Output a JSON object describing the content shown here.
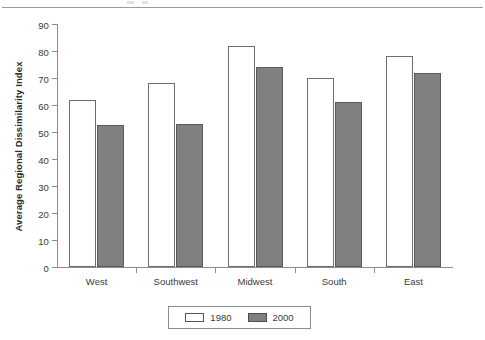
{
  "chart_data": {
    "type": "bar",
    "title": "",
    "subtitle": "",
    "xlabel": "",
    "ylabel": "Average Regional Dissimilarity Index",
    "categories": [
      "West",
      "Southwest",
      "Midwest",
      "South",
      "East"
    ],
    "series": [
      {
        "name": "1980",
        "values": [
          62,
          68,
          82,
          70,
          78
        ],
        "color": "#ffffff"
      },
      {
        "name": "2000",
        "values": [
          52.5,
          53,
          74,
          61,
          72
        ],
        "color": "#808080"
      }
    ],
    "ylim": [
      0,
      90
    ],
    "ytick_labels": [
      "90",
      "80",
      "70",
      "60",
      "50",
      "40",
      "30",
      "20",
      "10",
      "0"
    ],
    "ytick_values": [
      90,
      80,
      70,
      60,
      50,
      40,
      30,
      20,
      10,
      0
    ],
    "ytick_step": 10,
    "grid": false,
    "legend_position": "bottom-center",
    "legend_entries": [
      "1980",
      "2000"
    ]
  },
  "legend": {
    "entries": [
      {
        "label": "1980",
        "swatch": "open-white-bar-swatch"
      },
      {
        "label": "2000",
        "swatch": "filled-gray-bar-swatch"
      }
    ]
  },
  "colors": {
    "series_1980": "#ffffff",
    "series_2000": "#808080",
    "axis": "#8c8c8c",
    "text": "#3a3a3a",
    "rule": "#9a9a9a"
  }
}
